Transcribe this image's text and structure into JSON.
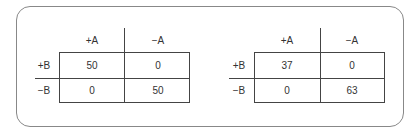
{
  "tables": [
    {
      "col_headers": [
        "+A",
        "−A"
      ],
      "row_headers": [
        "+B",
        "−B"
      ],
      "cells": [
        [
          "50",
          "0"
        ],
        [
          "0",
          "50"
        ]
      ]
    },
    {
      "col_headers": [
        "+A",
        "−A"
      ],
      "row_headers": [
        "+B",
        "−B"
      ],
      "cells": [
        [
          "37",
          "0"
        ],
        [
          "0",
          "63"
        ]
      ]
    }
  ]
}
